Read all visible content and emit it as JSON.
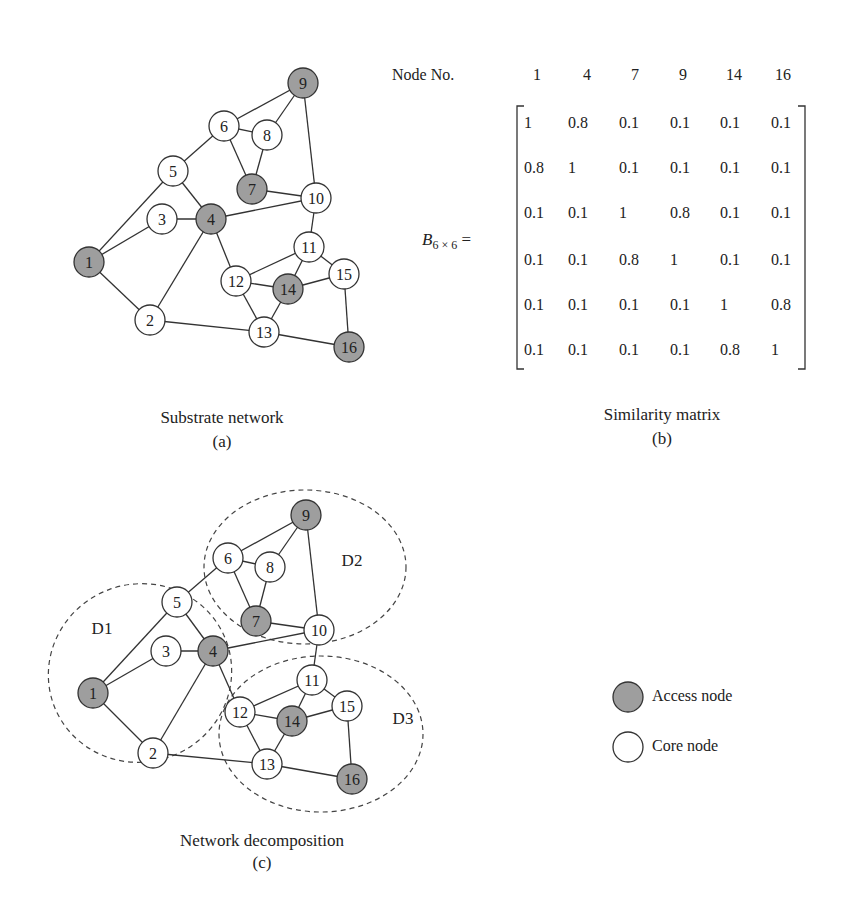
{
  "colors": {
    "access": "#9e9e9e",
    "core": "#ffffff",
    "stroke": "#333333"
  },
  "panel_a": {
    "caption": "Substrate network",
    "tag": "(a)",
    "nodes": [
      {
        "id": "1",
        "x": 89,
        "y": 262,
        "type": "access"
      },
      {
        "id": "2",
        "x": 150,
        "y": 320,
        "type": "core"
      },
      {
        "id": "3",
        "x": 162,
        "y": 219,
        "type": "core"
      },
      {
        "id": "4",
        "x": 211,
        "y": 219,
        "type": "access"
      },
      {
        "id": "5",
        "x": 173,
        "y": 171,
        "type": "core"
      },
      {
        "id": "6",
        "x": 224,
        "y": 126,
        "type": "core"
      },
      {
        "id": "7",
        "x": 252,
        "y": 189,
        "type": "access"
      },
      {
        "id": "8",
        "x": 267,
        "y": 135,
        "type": "core"
      },
      {
        "id": "9",
        "x": 303,
        "y": 83,
        "type": "access"
      },
      {
        "id": "10",
        "x": 316,
        "y": 198,
        "type": "core"
      },
      {
        "id": "11",
        "x": 309,
        "y": 247,
        "type": "core"
      },
      {
        "id": "12",
        "x": 236,
        "y": 281,
        "type": "core"
      },
      {
        "id": "13",
        "x": 264,
        "y": 332,
        "type": "core"
      },
      {
        "id": "14",
        "x": 288,
        "y": 289,
        "type": "access"
      },
      {
        "id": "15",
        "x": 344,
        "y": 274,
        "type": "core"
      },
      {
        "id": "16",
        "x": 349,
        "y": 347,
        "type": "access"
      }
    ]
  },
  "panel_c": {
    "caption": "Network decomposition",
    "tag": "(c)",
    "nodes": [
      {
        "id": "1",
        "x": 93,
        "y": 693,
        "type": "access"
      },
      {
        "id": "2",
        "x": 153,
        "y": 753,
        "type": "core"
      },
      {
        "id": "3",
        "x": 166,
        "y": 651,
        "type": "core"
      },
      {
        "id": "4",
        "x": 213,
        "y": 651,
        "type": "access"
      },
      {
        "id": "5",
        "x": 177,
        "y": 602,
        "type": "core"
      },
      {
        "id": "6",
        "x": 228,
        "y": 558,
        "type": "core"
      },
      {
        "id": "7",
        "x": 256,
        "y": 621,
        "type": "access"
      },
      {
        "id": "8",
        "x": 270,
        "y": 567,
        "type": "core"
      },
      {
        "id": "9",
        "x": 306,
        "y": 515,
        "type": "access"
      },
      {
        "id": "10",
        "x": 319,
        "y": 630,
        "type": "core"
      },
      {
        "id": "11",
        "x": 312,
        "y": 680,
        "type": "core"
      },
      {
        "id": "12",
        "x": 240,
        "y": 712,
        "type": "core"
      },
      {
        "id": "13",
        "x": 267,
        "y": 764,
        "type": "core"
      },
      {
        "id": "14",
        "x": 292,
        "y": 721,
        "type": "access"
      },
      {
        "id": "15",
        "x": 347,
        "y": 706,
        "type": "core"
      },
      {
        "id": "16",
        "x": 352,
        "y": 779,
        "type": "access"
      }
    ],
    "domains": [
      {
        "label": "D1",
        "cx": 140,
        "cy": 673,
        "rx": 92,
        "ry": 89,
        "rot": -20,
        "lx": 102,
        "ly": 628
      },
      {
        "label": "D2",
        "cx": 305,
        "cy": 567,
        "rx": 101,
        "ry": 77,
        "rot": 0,
        "lx": 352,
        "ly": 560
      },
      {
        "label": "D3",
        "cx": 321,
        "cy": 734,
        "rx": 102,
        "ry": 78,
        "rot": 0,
        "lx": 403,
        "ly": 718
      }
    ]
  },
  "edges": [
    [
      "9",
      "6"
    ],
    [
      "9",
      "8"
    ],
    [
      "9",
      "10"
    ],
    [
      "6",
      "8"
    ],
    [
      "6",
      "5"
    ],
    [
      "6",
      "7"
    ],
    [
      "8",
      "7"
    ],
    [
      "7",
      "10"
    ],
    [
      "5",
      "1"
    ],
    [
      "5",
      "4"
    ],
    [
      "3",
      "1"
    ],
    [
      "3",
      "4"
    ],
    [
      "4",
      "10"
    ],
    [
      "4",
      "2"
    ],
    [
      "4",
      "12"
    ],
    [
      "1",
      "2"
    ],
    [
      "2",
      "13"
    ],
    [
      "10",
      "11"
    ],
    [
      "11",
      "12"
    ],
    [
      "11",
      "14"
    ],
    [
      "11",
      "15"
    ],
    [
      "12",
      "14"
    ],
    [
      "12",
      "13"
    ],
    [
      "14",
      "15"
    ],
    [
      "14",
      "13"
    ],
    [
      "13",
      "16"
    ],
    [
      "15",
      "16"
    ]
  ],
  "panel_b": {
    "header_label": "Node No.",
    "columns": [
      "1",
      "4",
      "7",
      "9",
      "14",
      "16"
    ],
    "matrix_label": "B",
    "matrix_subscript": "6 × 6",
    "equals": "=",
    "rows": [
      [
        "1",
        "0.8",
        "0.1",
        "0.1",
        "0.1",
        "0.1"
      ],
      [
        "0.8",
        "1",
        "0.1",
        "0.1",
        "0.1",
        "0.1"
      ],
      [
        "0.1",
        "0.1",
        "1",
        "0.8",
        "0.1",
        "0.1"
      ],
      [
        "0.1",
        "0.1",
        "0.8",
        "1",
        "0.1",
        "0.1"
      ],
      [
        "0.1",
        "0.1",
        "0.1",
        "0.1",
        "1",
        "0.8"
      ],
      [
        "0.1",
        "0.1",
        "0.1",
        "0.1",
        "0.8",
        "1"
      ]
    ],
    "caption": "Similarity matrix",
    "tag": "(b)"
  },
  "legend": [
    {
      "label": "Access node",
      "type": "access"
    },
    {
      "label": "Core node",
      "type": "core"
    }
  ]
}
